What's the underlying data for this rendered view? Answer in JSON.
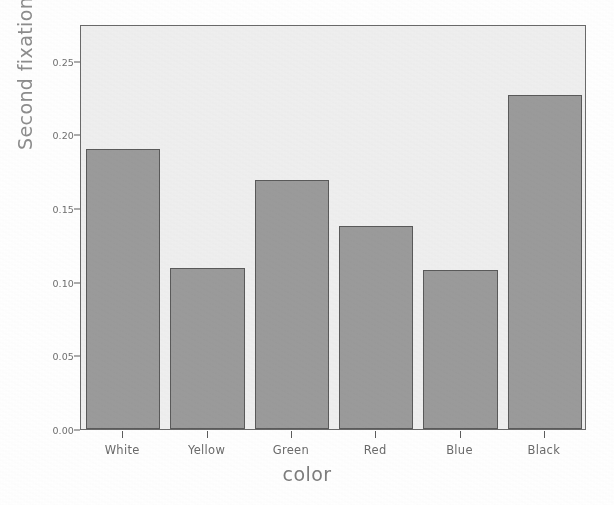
{
  "chart_data": {
    "type": "bar",
    "title": "",
    "xlabel": "color",
    "ylabel": "Second fixation time",
    "categories": [
      "White",
      "Yellow",
      "Green",
      "Red",
      "Blue",
      "Black"
    ],
    "values": [
      0.19,
      0.109,
      0.169,
      0.138,
      0.108,
      0.227
    ],
    "series": [
      {
        "name": "Second fixation time",
        "values": [
          0.19,
          0.109,
          0.169,
          0.138,
          0.108,
          0.227
        ]
      }
    ],
    "ylim": [
      0.0,
      0.275
    ],
    "yticks": [
      0.0,
      0.05,
      0.1,
      0.15,
      0.2,
      0.25
    ],
    "ytick_labels": [
      "0.00",
      "0.05",
      "0.10",
      "0.15",
      "0.20",
      "0.25"
    ],
    "grid": false,
    "legend": false,
    "legend_position": "none",
    "bar_color": "#9b9b9b",
    "bar_edge_color": "#5a5a5a",
    "plot_background": "#efefef",
    "page_background": "#ffffff",
    "axis_color": "#6a6a6a",
    "label_color": "#6f6f6f"
  },
  "axes": {
    "y_title": "Second fixation time",
    "x_title": "color",
    "y_tick_labels": [
      "0.25",
      "0.20",
      "0.15",
      "0.10",
      "0.05",
      "0.00"
    ],
    "x_tick_labels": [
      "White",
      "Yellow",
      "Green",
      "Red",
      "Blue",
      "Black"
    ]
  },
  "watermark": {
    "line1": "",
    "line2": "",
    "line3": ""
  }
}
